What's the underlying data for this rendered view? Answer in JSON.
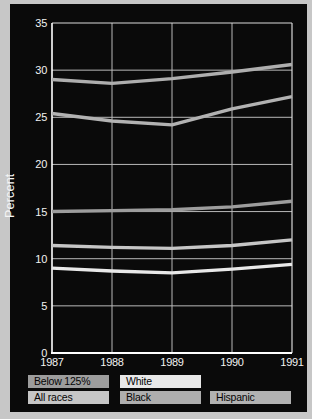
{
  "figure": {
    "frame_color": "#c7c7c7",
    "panel_color": "#0a0a0a",
    "grid_color": "#b9b9b9",
    "axis_color": "#ffffff",
    "border_color": "#d9d9d9",
    "tick_text_color": "#f2f2f2"
  },
  "chart_data": {
    "type": "line",
    "title": "",
    "xlabel": "",
    "ylabel": "Percent",
    "x": [
      1987,
      1988,
      1989,
      1990,
      1991
    ],
    "x_tick_labels": [
      "1987",
      "1988",
      "1989",
      "1990",
      "1991"
    ],
    "ylim": [
      0,
      35
    ],
    "ytick_step": 5,
    "grid": true,
    "legend_position": "bottom",
    "series": [
      {
        "name": "Black",
        "color": "#aeaeae",
        "values": [
          29.0,
          28.6,
          29.1,
          29.8,
          30.6
        ]
      },
      {
        "name": "Hispanic",
        "color": "#b2b2b2",
        "values": [
          25.4,
          24.6,
          24.2,
          25.9,
          27.2
        ]
      },
      {
        "name": "Below 125%",
        "color": "#9d9d9d",
        "values": [
          15.0,
          15.1,
          15.2,
          15.5,
          16.1
        ]
      },
      {
        "name": "All races",
        "color": "#c6c6c6",
        "values": [
          11.4,
          11.2,
          11.1,
          11.4,
          12.0
        ]
      },
      {
        "name": "White",
        "color": "#e8e8e8",
        "values": [
          9.0,
          8.7,
          8.5,
          8.9,
          9.4
        ]
      }
    ],
    "legend": {
      "rows": [
        [
          {
            "label": "Below 125%",
            "series": "Below 125%"
          },
          {
            "label": "White",
            "series": "White"
          }
        ],
        [
          {
            "label": "All races",
            "series": "All races"
          },
          {
            "label": "Black",
            "series": "Black"
          },
          {
            "label": "Hispanic",
            "series": "Hispanic"
          }
        ]
      ]
    }
  }
}
